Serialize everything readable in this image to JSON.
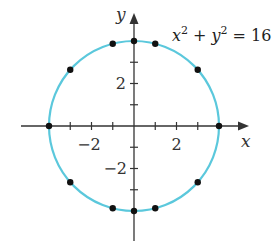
{
  "diagram": {
    "equation": {
      "x_var": "x",
      "y_var": "y",
      "exponent": "2",
      "plus": "+",
      "equals": "= 16"
    },
    "axes": {
      "x_label": "x",
      "y_label": "y",
      "x_ticks": [
        "−2",
        "2"
      ],
      "y_ticks": [
        "2",
        "−2"
      ]
    },
    "circle": {
      "radius": 4,
      "color": "#5bc8dc"
    },
    "points": [
      {
        "x": 4,
        "y": 0
      },
      {
        "x": -4,
        "y": 0
      },
      {
        "x": 0,
        "y": 4
      },
      {
        "x": 0,
        "y": -4
      },
      {
        "x": 1,
        "y": 3.873
      },
      {
        "x": -1,
        "y": 3.873
      },
      {
        "x": 1,
        "y": -3.873
      },
      {
        "x": -1,
        "y": -3.873
      },
      {
        "x": 3,
        "y": 2.646
      },
      {
        "x": -3,
        "y": 2.646
      },
      {
        "x": 3,
        "y": -2.646
      },
      {
        "x": -3,
        "y": -2.646
      }
    ]
  }
}
